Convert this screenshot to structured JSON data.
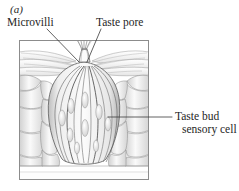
{
  "figure": {
    "panel_letter": "(a)",
    "alt": "Taste bud anatomy illustration",
    "labels": {
      "microvilli": "Microvilli",
      "taste_pore": "Taste pore",
      "sensory_cell_line1": "Taste bud",
      "sensory_cell_line2": "sensory cell"
    },
    "colors": {
      "background": "#ffffff",
      "frame_stroke": "#8c8c8c",
      "ink": "#262626",
      "leader_line": "#3a3a3a",
      "cell_outline": "#7a7a7a",
      "bud_outline": "#5a5a5a",
      "shade_light": "#f2f2f2",
      "shade_mid": "#d8d8d8",
      "shade_dark": "#a8a8a8",
      "nucleus": "#ededed"
    },
    "frame": {
      "x": 19,
      "y": 40,
      "width": 130,
      "height": 140
    },
    "leaders": {
      "microvilli": {
        "x1": 47,
        "y1": 29,
        "x2": 79,
        "y2": 62
      },
      "taste_pore": {
        "x1": 101,
        "y1": 29,
        "x2": 86,
        "y2": 62
      },
      "sensory_cell": {
        "x1": 108,
        "y1": 117,
        "x2": 172,
        "y2": 117
      }
    }
  }
}
